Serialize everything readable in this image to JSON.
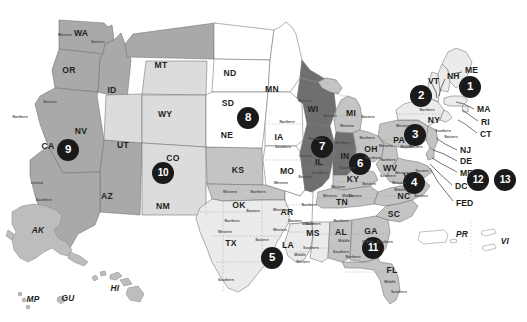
{
  "map": {
    "title": "United States Federal Judicial Circuits Map",
    "colors": {
      "badge_background": "#1a1a1a",
      "badge_text": "#ffffff",
      "circuit_9": "#a9a9a9",
      "circuit_10": "#dcdcdc",
      "circuit_8": "#ffffff",
      "circuit_7": "#6f6f6f",
      "circuit_6": "#c4c4c4",
      "circuit_5": "#ebebeb",
      "circuit_11": "#c4c4c4",
      "border": "#6f6f6f"
    },
    "circuits": [
      {
        "number": "1",
        "x": 470,
        "y": 87
      },
      {
        "number": "2",
        "x": 421,
        "y": 96
      },
      {
        "number": "3",
        "x": 415,
        "y": 135
      },
      {
        "number": "4",
        "x": 414,
        "y": 183
      },
      {
        "number": "5",
        "x": 272,
        "y": 258
      },
      {
        "number": "6",
        "x": 360,
        "y": 164
      },
      {
        "number": "7",
        "x": 322,
        "y": 147
      },
      {
        "number": "8",
        "x": 248,
        "y": 118
      },
      {
        "number": "9",
        "x": 68,
        "y": 150
      },
      {
        "number": "10",
        "x": 163,
        "y": 173
      },
      {
        "number": "11",
        "x": 373,
        "y": 248
      },
      {
        "number": "12",
        "x": 478,
        "y": 180
      },
      {
        "number": "13",
        "x": 505,
        "y": 180
      }
    ],
    "states": [
      {
        "abbr": "WA",
        "x": 81,
        "y": 33
      },
      {
        "abbr": "OR",
        "x": 69,
        "y": 70
      },
      {
        "abbr": "ID",
        "x": 112,
        "y": 90
      },
      {
        "abbr": "MT",
        "x": 161,
        "y": 65
      },
      {
        "abbr": "ND",
        "x": 230,
        "y": 73
      },
      {
        "abbr": "SD",
        "x": 228,
        "y": 103
      },
      {
        "abbr": "NE",
        "x": 227,
        "y": 135
      },
      {
        "abbr": "MN",
        "x": 272,
        "y": 89
      },
      {
        "abbr": "WY",
        "x": 165,
        "y": 114
      },
      {
        "abbr": "NV",
        "x": 81,
        "y": 131
      },
      {
        "abbr": "CA",
        "x": 48,
        "y": 146
      },
      {
        "abbr": "UT",
        "x": 123,
        "y": 145
      },
      {
        "abbr": "CO",
        "x": 173,
        "y": 158
      },
      {
        "abbr": "AZ",
        "x": 107,
        "y": 196
      },
      {
        "abbr": "NM",
        "x": 163,
        "y": 206
      },
      {
        "abbr": "KS",
        "x": 238,
        "y": 170
      },
      {
        "abbr": "OK",
        "x": 239,
        "y": 205
      },
      {
        "abbr": "TX",
        "x": 231,
        "y": 243
      },
      {
        "abbr": "IA",
        "x": 279,
        "y": 137
      },
      {
        "abbr": "MO",
        "x": 287,
        "y": 171
      },
      {
        "abbr": "AR",
        "x": 287,
        "y": 212
      },
      {
        "abbr": "LA",
        "x": 288,
        "y": 245
      },
      {
        "abbr": "MS",
        "x": 313,
        "y": 233
      },
      {
        "abbr": "AL",
        "x": 341,
        "y": 232
      },
      {
        "abbr": "GA",
        "x": 371,
        "y": 231
      },
      {
        "abbr": "FL",
        "x": 392,
        "y": 270
      },
      {
        "abbr": "WI",
        "x": 313,
        "y": 109
      },
      {
        "abbr": "MI",
        "x": 351,
        "y": 113
      },
      {
        "abbr": "IL",
        "x": 319,
        "y": 162
      },
      {
        "abbr": "IN",
        "x": 345,
        "y": 156
      },
      {
        "abbr": "OH",
        "x": 371,
        "y": 149
      },
      {
        "abbr": "KY",
        "x": 353,
        "y": 179
      },
      {
        "abbr": "TN",
        "x": 342,
        "y": 202
      },
      {
        "abbr": "WV",
        "x": 390,
        "y": 168
      },
      {
        "abbr": "VA",
        "x": 409,
        "y": 176
      },
      {
        "abbr": "NC",
        "x": 404,
        "y": 196
      },
      {
        "abbr": "SC",
        "x": 394,
        "y": 214
      },
      {
        "abbr": "PA",
        "x": 399,
        "y": 140
      },
      {
        "abbr": "NY",
        "x": 434,
        "y": 120
      }
    ],
    "edge_labels": [
      {
        "abbr": "ME",
        "x": 465,
        "y": 70
      },
      {
        "abbr": "NH",
        "x": 447,
        "y": 76
      },
      {
        "abbr": "VT",
        "x": 428,
        "y": 81
      },
      {
        "abbr": "MA",
        "x": 477,
        "y": 109
      },
      {
        "abbr": "RI",
        "x": 481,
        "y": 122
      },
      {
        "abbr": "CT",
        "x": 480,
        "y": 134
      },
      {
        "abbr": "NJ",
        "x": 460,
        "y": 150
      },
      {
        "abbr": "DE",
        "x": 460,
        "y": 161
      },
      {
        "abbr": "MD",
        "x": 460,
        "y": 173
      },
      {
        "abbr": "DC",
        "x": 455,
        "y": 186
      },
      {
        "abbr": "FED",
        "x": 456,
        "y": 203
      }
    ],
    "territories": [
      {
        "abbr": "AK",
        "x": 38,
        "y": 230
      },
      {
        "abbr": "HI",
        "x": 115,
        "y": 288
      },
      {
        "abbr": "MP",
        "x": 33,
        "y": 299
      },
      {
        "abbr": "GU",
        "x": 68,
        "y": 298
      },
      {
        "abbr": "PR",
        "x": 462,
        "y": 234
      },
      {
        "abbr": "VI",
        "x": 505,
        "y": 241
      }
    ],
    "district_labels": [
      {
        "text": "Western",
        "x": 65,
        "y": 35
      },
      {
        "text": "Eastern",
        "x": 98,
        "y": 42
      },
      {
        "text": "Eastern",
        "x": 50,
        "y": 102
      },
      {
        "text": "Northern",
        "x": 20,
        "y": 117
      },
      {
        "text": "Central",
        "x": 37,
        "y": 183
      },
      {
        "text": "Southern",
        "x": 44,
        "y": 200
      },
      {
        "text": "Northern",
        "x": 287,
        "y": 122
      },
      {
        "text": "Southern",
        "x": 283,
        "y": 147
      },
      {
        "text": "Western",
        "x": 281,
        "y": 183
      },
      {
        "text": "Eastern",
        "x": 305,
        "y": 177
      },
      {
        "text": "Northern",
        "x": 309,
        "y": 205
      },
      {
        "text": "Eastern",
        "x": 295,
        "y": 221
      },
      {
        "text": "Western",
        "x": 280,
        "y": 230
      },
      {
        "text": "Western",
        "x": 280,
        "y": 210
      },
      {
        "text": "Middle",
        "x": 308,
        "y": 224
      },
      {
        "text": "Northern",
        "x": 232,
        "y": 221
      },
      {
        "text": "Western",
        "x": 225,
        "y": 232
      },
      {
        "text": "Eastern",
        "x": 262,
        "y": 240
      },
      {
        "text": "Southern",
        "x": 226,
        "y": 280
      },
      {
        "text": "Western",
        "x": 230,
        "y": 192
      },
      {
        "text": "Northern",
        "x": 258,
        "y": 192
      },
      {
        "text": "Eastern",
        "x": 253,
        "y": 211
      },
      {
        "text": "Northern",
        "x": 313,
        "y": 224
      },
      {
        "text": "Southern",
        "x": 311,
        "y": 248
      },
      {
        "text": "Middle",
        "x": 300,
        "y": 255
      },
      {
        "text": "Eastern",
        "x": 303,
        "y": 262
      },
      {
        "text": "Northern",
        "x": 341,
        "y": 221
      },
      {
        "text": "Middle",
        "x": 344,
        "y": 241
      },
      {
        "text": "Southern",
        "x": 341,
        "y": 252
      },
      {
        "text": "Northern",
        "x": 353,
        "y": 257
      },
      {
        "text": "Middle",
        "x": 368,
        "y": 242
      },
      {
        "text": "Southern",
        "x": 385,
        "y": 242
      },
      {
        "text": "Middle",
        "x": 390,
        "y": 282
      },
      {
        "text": "Southern",
        "x": 399,
        "y": 292
      },
      {
        "text": "Western",
        "x": 305,
        "y": 101
      },
      {
        "text": "Eastern",
        "x": 330,
        "y": 116
      },
      {
        "text": "Northern",
        "x": 316,
        "y": 139
      },
      {
        "text": "Central",
        "x": 305,
        "y": 156
      },
      {
        "text": "Southern",
        "x": 320,
        "y": 173
      },
      {
        "text": "Northern",
        "x": 343,
        "y": 143
      },
      {
        "text": "Southern",
        "x": 347,
        "y": 168
      },
      {
        "text": "Western",
        "x": 347,
        "y": 126
      },
      {
        "text": "Eastern",
        "x": 368,
        "y": 117
      },
      {
        "text": "Northern",
        "x": 367,
        "y": 138
      },
      {
        "text": "Southern",
        "x": 373,
        "y": 158
      },
      {
        "text": "Western",
        "x": 338,
        "y": 187
      },
      {
        "text": "Eastern",
        "x": 369,
        "y": 184
      },
      {
        "text": "Eastern",
        "x": 355,
        "y": 196
      },
      {
        "text": "Middle",
        "x": 348,
        "y": 196
      },
      {
        "text": "Western",
        "x": 330,
        "y": 196
      },
      {
        "text": "Northern",
        "x": 388,
        "y": 160
      },
      {
        "text": "Southern",
        "x": 388,
        "y": 176
      },
      {
        "text": "Western",
        "x": 399,
        "y": 183
      },
      {
        "text": "Middle",
        "x": 400,
        "y": 190
      },
      {
        "text": "Eastern",
        "x": 421,
        "y": 196
      },
      {
        "text": "Western",
        "x": 402,
        "y": 173
      },
      {
        "text": "Eastern",
        "x": 422,
        "y": 171
      },
      {
        "text": "Western",
        "x": 386,
        "y": 146
      },
      {
        "text": "Eastern",
        "x": 416,
        "y": 147
      },
      {
        "text": "Middle",
        "x": 406,
        "y": 147
      },
      {
        "text": "Western",
        "x": 403,
        "y": 126
      },
      {
        "text": "Northern",
        "x": 427,
        "y": 110
      },
      {
        "text": "Southern",
        "x": 443,
        "y": 131
      },
      {
        "text": "Eastern",
        "x": 451,
        "y": 137
      }
    ]
  }
}
